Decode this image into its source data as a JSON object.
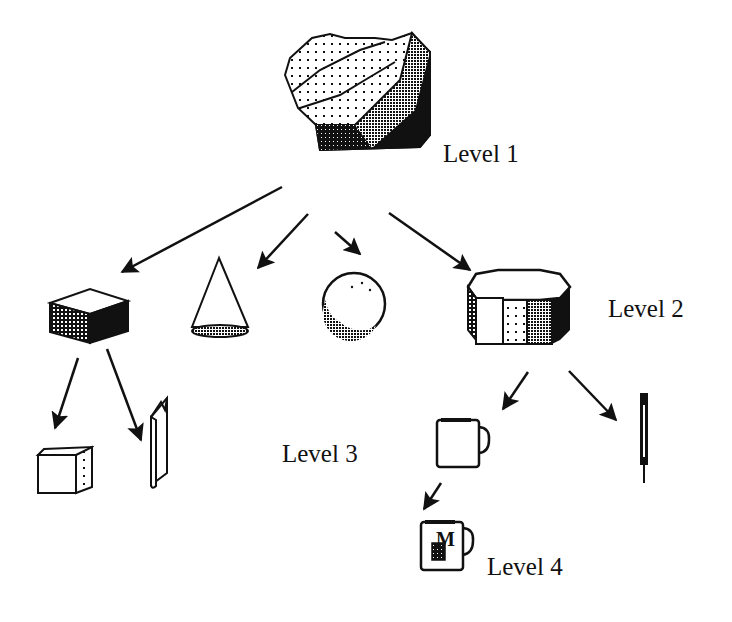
{
  "diagram": {
    "type": "hierarchy",
    "levels": [
      {
        "label": "Level 1",
        "nodes": [
          "faceted-mass"
        ]
      },
      {
        "label": "Level 2",
        "nodes": [
          "box",
          "cone",
          "sphere",
          "octagonal-cylinder"
        ]
      },
      {
        "label": "Level 3",
        "nodes": [
          "cube",
          "book",
          "mug",
          "pen"
        ]
      },
      {
        "label": "Level 4",
        "nodes": [
          "mug-with-logo"
        ]
      }
    ],
    "edges": [
      {
        "from": "faceted-mass",
        "to": "box"
      },
      {
        "from": "faceted-mass",
        "to": "cone"
      },
      {
        "from": "faceted-mass",
        "to": "sphere"
      },
      {
        "from": "faceted-mass",
        "to": "octagonal-cylinder"
      },
      {
        "from": "box",
        "to": "cube"
      },
      {
        "from": "box",
        "to": "book"
      },
      {
        "from": "octagonal-cylinder",
        "to": "mug"
      },
      {
        "from": "octagonal-cylinder",
        "to": "pen"
      },
      {
        "from": "mug",
        "to": "mug-with-logo"
      }
    ],
    "mug_logo_letter": "M"
  },
  "labels": {
    "level1": "Level 1",
    "level2": "Level 2",
    "level3": "Level 3",
    "level4": "Level 4"
  },
  "colors": {
    "ink": "#111111",
    "background": "#ffffff"
  }
}
